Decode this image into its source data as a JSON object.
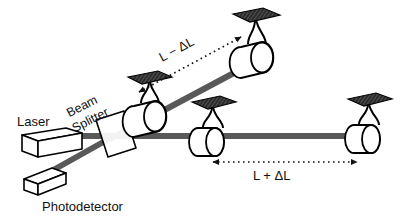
{
  "figure": {
    "type": "optics-diagram",
    "background_color": "#ffffff",
    "beam_color": "#595959",
    "outline_color": "#000000",
    "plate_color": "#2b2b2b"
  },
  "labels": {
    "laser": "Laser",
    "beam_splitter_line1": "Beam",
    "beam_splitter_line2": "Splitter",
    "photodetector": "Photodetector",
    "arm_short": "L − ΔL",
    "arm_long": "L + ΔL"
  },
  "components": [
    {
      "name": "laser",
      "label": "Laser",
      "shape": "rectangular-box"
    },
    {
      "name": "photodetector",
      "label": "Photodetector",
      "shape": "rectangular-box"
    },
    {
      "name": "beam-splitter",
      "label": "Beam Splitter",
      "shape": "tilted-plate"
    },
    {
      "name": "test-mass-vertical-near",
      "label": "",
      "shape": "suspended-cylinder"
    },
    {
      "name": "test-mass-vertical-far",
      "label": "",
      "shape": "suspended-cylinder"
    },
    {
      "name": "test-mass-horizontal-near",
      "label": "",
      "shape": "suspended-cylinder"
    },
    {
      "name": "test-mass-horizontal-far",
      "label": "",
      "shape": "suspended-cylinder"
    }
  ],
  "arms": [
    {
      "name": "short-arm",
      "annotation": "L − ΔL",
      "orientation": "diagonal",
      "arrow": "double-headed-dotted"
    },
    {
      "name": "long-arm",
      "annotation": "L + ΔL",
      "orientation": "horizontal",
      "arrow": "double-headed-dotted"
    }
  ]
}
